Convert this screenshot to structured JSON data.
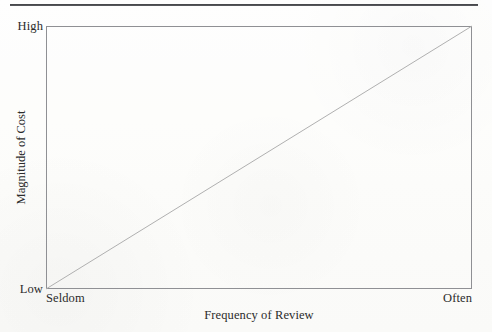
{
  "figure": {
    "background_color": "#fdfdfb",
    "rule_color": "#3b3c40",
    "frame_color": "#8f9094",
    "line_color": "#b0b0b0"
  },
  "chart_data": {
    "type": "line",
    "title": "",
    "subtitle": "",
    "xlabel": "Frequency of Review",
    "ylabel": "Magnitude of Cost",
    "x_tick_labels": [
      "Seldom",
      "Often"
    ],
    "y_tick_labels": [
      "Low",
      "High"
    ],
    "xlim": [
      0,
      1
    ],
    "ylim": [
      0,
      1
    ],
    "grid": false,
    "legend": null,
    "annotations": [],
    "series": [
      {
        "name": "Cost of review",
        "x": [
          0,
          1
        ],
        "values": [
          0,
          1
        ],
        "style": "straight-line",
        "color": "#b0b0b0"
      }
    ]
  }
}
